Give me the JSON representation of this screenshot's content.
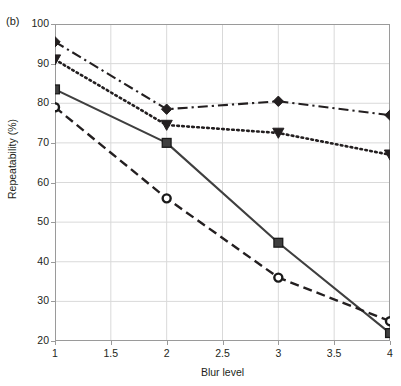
{
  "panel": {
    "label": "(b)"
  },
  "axes": {
    "xlabel": "Blur level",
    "ylabel": "Repeatability (%)",
    "xticks": [
      "1",
      "1.5",
      "2",
      "2.5",
      "3",
      "3.5",
      "4"
    ],
    "yticks": [
      "100",
      "90",
      "80",
      "70",
      "60",
      "50",
      "40",
      "30",
      "20"
    ]
  },
  "colors": {
    "ink": "#231f20",
    "grid": "#d9d9d9",
    "frame": "#9a9a9a",
    "background": "#ffffff"
  },
  "chart_data": {
    "type": "line",
    "title": "(b)",
    "xlabel": "Blur level",
    "ylabel": "Repeatability (%)",
    "xlim": [
      1,
      4
    ],
    "ylim": [
      20,
      100
    ],
    "grid": true,
    "legend": "none",
    "x": [
      1,
      2,
      3,
      4
    ],
    "xtick_values": [
      1,
      1.5,
      2,
      2.5,
      3,
      3.5,
      4
    ],
    "ytick_values": [
      100,
      90,
      80,
      70,
      60,
      50,
      40,
      30,
      20
    ],
    "series": [
      {
        "name": "series-1",
        "marker": "diamond",
        "linestyle": "dash-dot",
        "color": "#231f20",
        "values": [
          95.5,
          78.5,
          80.5,
          77
        ]
      },
      {
        "name": "series-2",
        "marker": "triangle-down",
        "linestyle": "dotted",
        "color": "#231f20",
        "values": [
          91,
          74.5,
          72.5,
          67
        ]
      },
      {
        "name": "series-3",
        "marker": "square",
        "linestyle": "solid",
        "color": "#3f3f3f",
        "values": [
          83.5,
          70,
          44.8,
          22
        ]
      },
      {
        "name": "series-4",
        "marker": "circle",
        "linestyle": "dashed",
        "color": "#231f20",
        "values": [
          79,
          56,
          36,
          25
        ]
      }
    ]
  }
}
